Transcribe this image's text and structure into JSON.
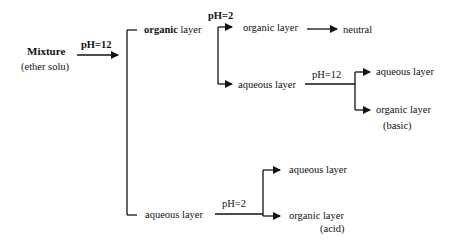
{
  "diagram": {
    "start": {
      "title": "Mixture",
      "subtitle": "(ether solu)"
    },
    "step1": {
      "condition": "pH=12"
    },
    "branch_organic": {
      "label_bold": "organic",
      "label_rest": " layer",
      "condition": "pH=2",
      "children": {
        "organic": {
          "label": "organic layer",
          "result": "neutral"
        },
        "aqueous": {
          "label": "aqueous layer",
          "condition": "pH=12",
          "children": {
            "aqueous": {
              "label": "aqueous layer"
            },
            "organic": {
              "label": "organic layer",
              "note": "(basic)"
            }
          }
        }
      }
    },
    "branch_aqueous": {
      "label": "aqueous layer",
      "condition": "pH=2",
      "children": {
        "aqueous": {
          "label": "aqueous layer"
        },
        "organic": {
          "label": "organic layer",
          "note": "(acid)"
        }
      }
    },
    "colors": {
      "line": "#111111",
      "background": "#ffffff"
    }
  }
}
